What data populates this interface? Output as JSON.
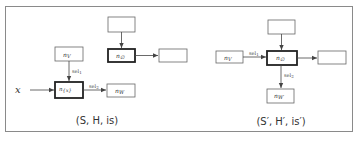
{
  "diagram": {
    "left": {
      "caption": "(S, H, is)",
      "input_label": "x",
      "nodes": [
        {
          "id": "top",
          "label": "",
          "x": 108,
          "y": 17,
          "w": 27,
          "h": 15,
          "bold": false
        },
        {
          "id": "nV",
          "label": "nV",
          "x": 55,
          "y": 47,
          "w": 28,
          "h": 14,
          "bold": false
        },
        {
          "id": "nEmpty",
          "label": "n∅",
          "x": 108,
          "y": 49,
          "w": 27,
          "h": 13,
          "bold": true
        },
        {
          "id": "right",
          "label": "",
          "x": 159,
          "y": 49,
          "w": 28,
          "h": 13,
          "bold": false
        },
        {
          "id": "nx",
          "label": "n{x}",
          "x": 55,
          "y": 82,
          "w": 28,
          "h": 16,
          "bold": true
        },
        {
          "id": "nW",
          "label": "nW",
          "x": 107,
          "y": 84,
          "w": 28,
          "h": 13,
          "bold": false
        }
      ],
      "edges": [
        {
          "from": "top",
          "to": "nEmpty",
          "label": ""
        },
        {
          "from": "nEmpty",
          "to": "right",
          "label": ""
        },
        {
          "from": "nV",
          "to": "nx",
          "label": "sel1"
        },
        {
          "from": "nx",
          "to": "nW",
          "label": "sel2"
        }
      ]
    },
    "right": {
      "caption": "(S′, H′, is′)",
      "nodes": [
        {
          "id": "top",
          "label": "",
          "x": 268,
          "y": 20,
          "w": 27,
          "h": 14,
          "bold": false
        },
        {
          "id": "nV",
          "label": "nV",
          "x": 216,
          "y": 51,
          "w": 27,
          "h": 12,
          "bold": false
        },
        {
          "id": "nEmpty",
          "label": "n∅",
          "x": 267,
          "y": 51,
          "w": 30,
          "h": 14,
          "bold": true
        },
        {
          "id": "right",
          "label": "",
          "x": 318,
          "y": 51,
          "w": 28,
          "h": 13,
          "bold": false
        },
        {
          "id": "nW",
          "label": "nW",
          "x": 267,
          "y": 89,
          "w": 27,
          "h": 14,
          "bold": false
        }
      ],
      "edges": [
        {
          "from": "top",
          "to": "nEmpty",
          "label": ""
        },
        {
          "from": "nV",
          "to": "nEmpty",
          "label": "sel1"
        },
        {
          "from": "nEmpty",
          "to": "right",
          "label": ""
        },
        {
          "from": "nEmpty",
          "to": "nW",
          "label": "sel2"
        }
      ]
    },
    "colors": {
      "stroke": "#555555",
      "frame": "#8a8a8a",
      "text": "#333333"
    }
  }
}
